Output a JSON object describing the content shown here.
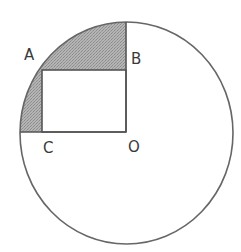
{
  "diagram": {
    "type": "geometry",
    "labels": {
      "A": "A",
      "B": "B",
      "C": "C",
      "O": "O"
    },
    "colors": {
      "stroke": "#555555",
      "shade": "#a9a9a9",
      "background": "#ffffff"
    },
    "shapes": {
      "circle": {
        "cx": 126.5,
        "cy": 133,
        "rx": 106.5,
        "ry": 111
      },
      "rectangle": {
        "x": 42,
        "y": 70,
        "width": 84,
        "height": 62
      },
      "radius_vertical": {
        "x": 126,
        "y1": 22,
        "y2": 132
      },
      "radius_horizontal": {
        "y": 132,
        "x1": 20,
        "x2": 126
      }
    }
  }
}
